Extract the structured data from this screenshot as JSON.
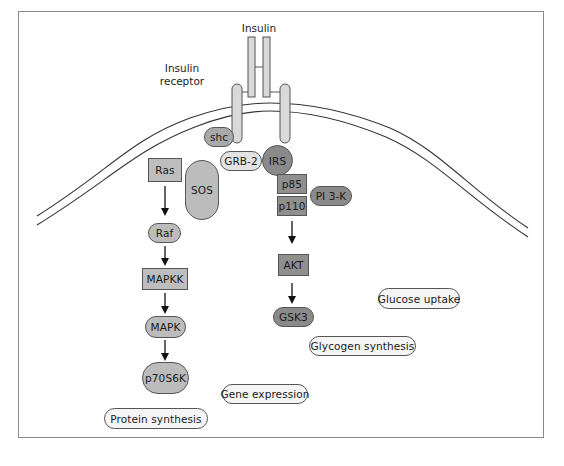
{
  "labels": {
    "insulin": "Insulin",
    "receptor_line1": "Insulin",
    "receptor_line2": "receptor"
  },
  "colors": {
    "frame": "#8a8a8a",
    "membrane": "#333333",
    "receptor_fill": "#d9d9d9",
    "light_box": "#bdbdbd",
    "dark_box": "#8f8f8f",
    "dark_pill": "#8a8a8a",
    "medium_pill": "#bcbcbc",
    "shc": "#a9a9a9",
    "grb2": "#e3e3e3",
    "outcome": "#f5f5f5"
  },
  "nodes": {
    "shc": "shc",
    "grb2": "GRB-2",
    "irs": "IRS",
    "ras": "Ras",
    "sos": "SOS",
    "raf": "Raf",
    "mapkk": "MAPKK",
    "mapk": "MAPK",
    "p70s6k": "p70S6K",
    "p85": "p85",
    "p110": "p110",
    "pi3k": "PI 3-K",
    "akt": "AKT",
    "gsk3": "GSK3"
  },
  "outcomes": {
    "glucose_uptake": "Glucose uptake",
    "glycogen_synthesis": "Glycogen synthesis",
    "gene_expression": "Gene expression",
    "protein_synthesis": "Protein synthesis"
  },
  "edges": [
    {
      "from": "Ras",
      "to": "Raf"
    },
    {
      "from": "Raf",
      "to": "MAPKK"
    },
    {
      "from": "MAPKK",
      "to": "MAPK"
    },
    {
      "from": "MAPK",
      "to": "p70S6K"
    },
    {
      "from": "p110",
      "to": "AKT"
    },
    {
      "from": "AKT",
      "to": "GSK3"
    }
  ]
}
